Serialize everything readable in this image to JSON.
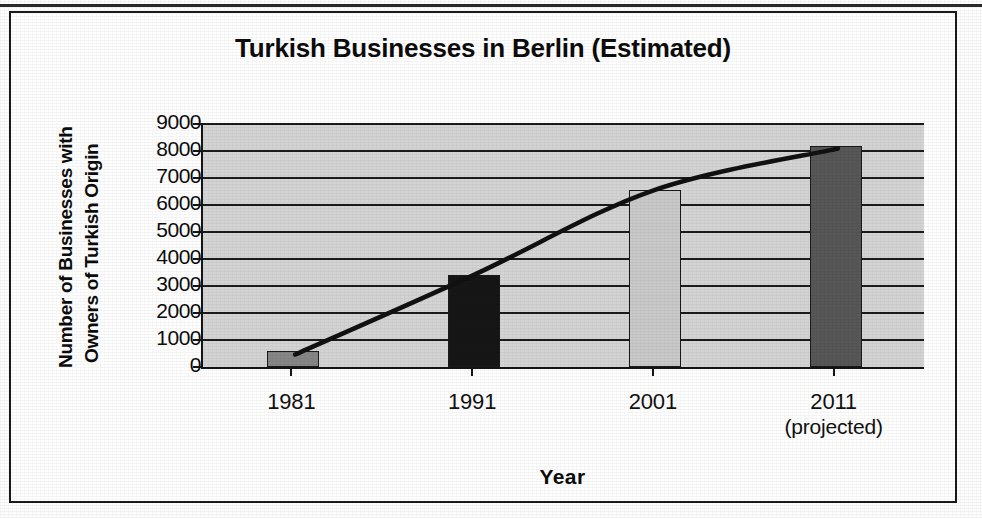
{
  "chart_data": {
    "type": "bar",
    "title": "Turkish Businesses in Berlin (Estimated)",
    "xlabel": "Year",
    "ylabel_line1": "Number of Businesses with",
    "ylabel_line2": "Owners of Turkish Origin",
    "categories": [
      "1981",
      "1991",
      "2001",
      "2011"
    ],
    "category_sublabels": [
      "",
      "",
      "",
      "(projected)"
    ],
    "values": [
      600,
      3400,
      6550,
      8200
    ],
    "ylim": [
      0,
      9000
    ],
    "ytick_labels": [
      "9000",
      "8000",
      "7000",
      "6000",
      "5000",
      "4000",
      "3000",
      "2000",
      "1000",
      "0"
    ],
    "ytick_values": [
      9000,
      8000,
      7000,
      6000,
      5000,
      4000,
      3000,
      2000,
      1000,
      0
    ],
    "grid": true,
    "legend": "none",
    "bar_colors": [
      "#868686",
      "#161616",
      "#c9c9c9",
      "#575757"
    ],
    "plot_background": "#d4d4d4",
    "axis_color": "#141414",
    "trend_line": {
      "present": true,
      "style": "smooth-curve",
      "color": "#111111",
      "points": [
        {
          "x": 600,
          "y": 450
        },
        {
          "x": 1991,
          "y": 3400
        },
        {
          "x": 2001,
          "y": 6550
        },
        {
          "x": 2011,
          "y": 8100
        }
      ]
    }
  },
  "chart": {
    "title": "Turkish Businesses in Berlin (Estimated)",
    "x_axis_title": "Year",
    "y_axis_title_line1": "Number of Businesses with",
    "y_axis_title_line2": "Owners of Turkish Origin",
    "y_ticks": [
      {
        "label": "9000"
      },
      {
        "label": "8000"
      },
      {
        "label": "7000"
      },
      {
        "label": "6000"
      },
      {
        "label": "5000"
      },
      {
        "label": "4000"
      },
      {
        "label": "3000"
      },
      {
        "label": "2000"
      },
      {
        "label": "1000"
      },
      {
        "label": "0"
      }
    ],
    "x_ticks": [
      {
        "label": "1981",
        "sublabel": ""
      },
      {
        "label": "1991",
        "sublabel": ""
      },
      {
        "label": "2001",
        "sublabel": ""
      },
      {
        "label": "2011",
        "sublabel": "(projected)"
      }
    ]
  }
}
